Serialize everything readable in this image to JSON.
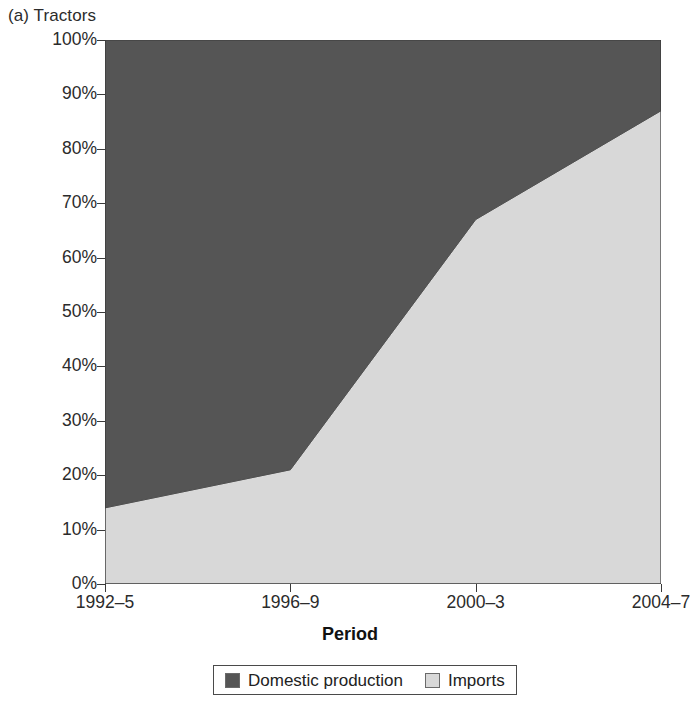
{
  "caption": "(a) Tractors",
  "axes": {
    "y_title": "Shares",
    "x_title": "Period"
  },
  "legend": {
    "items": [
      {
        "label": "Domestic production",
        "color": "#555555",
        "swatch": "domestic-swatch"
      },
      {
        "label": "Imports",
        "color": "#d8d8d8",
        "swatch": "imports-swatch"
      }
    ]
  },
  "chart_data": {
    "type": "area",
    "title": "(a) Tractors",
    "xlabel": "Period",
    "ylabel": "Shares",
    "stacked": true,
    "percent": true,
    "grid": false,
    "legend_position": "bottom",
    "ylim": [
      0,
      100
    ],
    "ytick_labels": [
      "0%",
      "10%",
      "20%",
      "30%",
      "40%",
      "50%",
      "60%",
      "70%",
      "80%",
      "90%",
      "100%"
    ],
    "ytick_values": [
      0,
      10,
      20,
      30,
      40,
      50,
      60,
      70,
      80,
      90,
      100
    ],
    "categories": [
      "1992–5",
      "1996–9",
      "2000–3",
      "2004–7"
    ],
    "series": [
      {
        "name": "Imports",
        "color": "#d8d8d8",
        "values": [
          14,
          21,
          67,
          87
        ]
      },
      {
        "name": "Domestic production",
        "color": "#555555",
        "values": [
          86,
          79,
          33,
          13
        ]
      }
    ]
  }
}
